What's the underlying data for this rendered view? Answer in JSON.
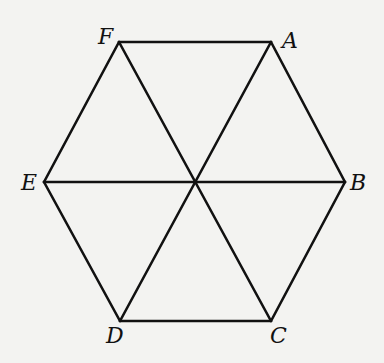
{
  "diagram": {
    "type": "regular-hexagon",
    "stroke_color": "#111111",
    "background": "#f3f3f1",
    "vertices": {
      "A": {
        "label": "A",
        "x": 271,
        "y": 42
      },
      "B": {
        "label": "B",
        "x": 345,
        "y": 182
      },
      "C": {
        "label": "C",
        "x": 271,
        "y": 321
      },
      "D": {
        "label": "D",
        "x": 120,
        "y": 321
      },
      "E": {
        "label": "E",
        "x": 44,
        "y": 182
      },
      "F": {
        "label": "F",
        "x": 119,
        "y": 42
      }
    },
    "center": {
      "x": 194,
      "y": 182
    },
    "sides": [
      "FA",
      "AB",
      "BC",
      "CD",
      "DE",
      "EF"
    ],
    "diagonals": [
      "FC",
      "AD",
      "EB"
    ],
    "labels": {
      "A": "A",
      "B": "B",
      "C": "C",
      "D": "D",
      "E": "E",
      "F": "F"
    }
  }
}
